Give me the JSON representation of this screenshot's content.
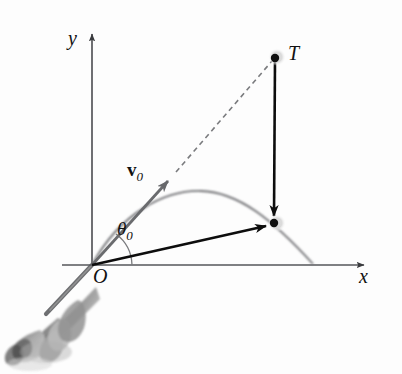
{
  "figure": {
    "background_color": "#fdfdfd",
    "labels": {
      "y_axis": "y",
      "x_axis": "x",
      "origin": "O",
      "target_point": "T",
      "angle_symbol": "θ",
      "angle_subscript": "0",
      "velocity_symbol": "v",
      "velocity_subscript": "0"
    },
    "colors": {
      "axis": "#55565a",
      "trajectory": "#6f7073",
      "velocity_vector": "#6a6b6e",
      "dashed_line": "#7a7b7e",
      "position_vector": "#0d0d0d",
      "drop_vector": "#0d0d0d",
      "angle_arc": "#7a7b7e",
      "point_marker": "#101010",
      "photo_gray": "#8e8e8e"
    },
    "geometry": {
      "origin": [
        92,
        265
      ],
      "y_axis_top": [
        92,
        30
      ],
      "x_axis_right": [
        368,
        265
      ],
      "target_T": [
        275,
        58
      ],
      "projectile_point": [
        273,
        223
      ],
      "v0_arrow_tip": [
        173,
        177
      ],
      "trajectory_apex": [
        201,
        191
      ],
      "trajectory_landing": [
        313,
        265
      ],
      "angle_arc_radius": 40,
      "launch_angle_degrees": 53
    },
    "elements": [
      "y-axis arrow",
      "x-axis arrow",
      "initial velocity vector v0",
      "dashed projection line to T",
      "parabolic trajectory curve",
      "vertical drop arrow from T to projectile",
      "position vector from O to projectile",
      "launch angle arc theta0",
      "launcher photograph"
    ]
  }
}
